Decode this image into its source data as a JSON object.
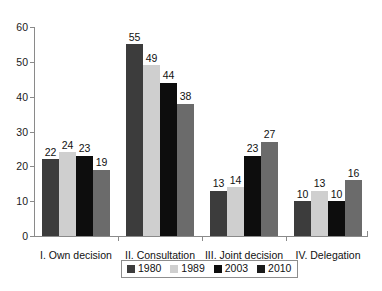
{
  "chart_data": {
    "type": "bar",
    "title": "",
    "subtitle": "",
    "xlabel": "",
    "ylabel": "",
    "ylim": [
      0,
      60
    ],
    "ytick_labels": [
      "0",
      "10",
      "20",
      "30",
      "40",
      "50",
      "60"
    ],
    "ytick_values": [
      0,
      10,
      20,
      30,
      40,
      50,
      60
    ],
    "grid": false,
    "legend_position": "bottom",
    "categories": [
      "I. Own decision",
      "II. Consultation",
      "III. Joint decision",
      "IV. Delegation"
    ],
    "series": [
      {
        "name": "1980",
        "color": "#3c3c3c",
        "values": [
          22,
          55,
          13,
          10
        ]
      },
      {
        "name": "1989",
        "color": "#cfcfcf",
        "values": [
          24,
          49,
          14,
          13
        ]
      },
      {
        "name": "2003",
        "color": "#0d0d0d",
        "values": [
          23,
          44,
          23,
          10
        ]
      },
      {
        "name": "2010",
        "color": "#6b6b6b",
        "values": [
          19,
          38,
          27,
          16
        ]
      }
    ],
    "data_labels": [
      [
        "22",
        "24",
        "23",
        "19"
      ],
      [
        "55",
        "49",
        "44",
        "38"
      ],
      [
        "13",
        "14",
        "23",
        "27"
      ],
      [
        "10",
        "13",
        "10",
        "16"
      ]
    ]
  },
  "legend": {
    "items": [
      {
        "label": "1980",
        "swatch_color": "#3c3c3c"
      },
      {
        "label": "1989",
        "swatch_color": "#cfcfcf"
      },
      {
        "label": "2003",
        "swatch_color": "#0d0d0d"
      },
      {
        "label": "2010",
        "swatch_color": "#1a1a1a"
      }
    ]
  },
  "axes": {
    "axis_color": "#8a8a8a"
  }
}
